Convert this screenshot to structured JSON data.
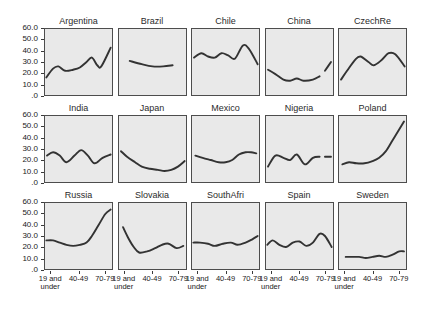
{
  "figure": {
    "background_color": "#ffffff",
    "panel_fill": "#e9e9e9",
    "panel_border_color": "#4d4d4d",
    "line_color": "#333333"
  },
  "axis": {
    "y_tick_labels": [
      "60.0",
      "50.0",
      "40.0",
      "30.0",
      "20.0",
      "10.0",
      ".0"
    ],
    "x_tick_labels": [
      "19 and under",
      "40-49",
      "70-79"
    ]
  },
  "chart_data": {
    "type": "line",
    "title": "",
    "xlabel": "",
    "ylabel": "",
    "ylim": [
      0,
      60
    ],
    "yticks": [
      0,
      10,
      20,
      30,
      40,
      50,
      60
    ],
    "ytick_labels": [
      "60.0",
      "50.0",
      "40.0",
      "30.0",
      "20.0",
      "10.0",
      ".0"
    ],
    "x": [
      "19 and under",
      "20-29",
      "30-39",
      "40-49",
      "50-59",
      "60-69",
      "70-79",
      "80 and over"
    ],
    "xticks": [
      "19 and under",
      "40-49",
      "70-79"
    ],
    "grid": false,
    "legend": "none",
    "layout": {
      "rows": 3,
      "cols": 5
    },
    "panels": [
      {
        "name": "Argentina",
        "row": 1,
        "col": 1,
        "values": [
          16,
          24,
          26,
          22,
          23,
          25,
          30,
          34,
          27,
          26,
          43
        ],
        "points": [
          [
            0.02,
            16
          ],
          [
            0.12,
            24
          ],
          [
            0.2,
            26
          ],
          [
            0.3,
            22
          ],
          [
            0.42,
            23
          ],
          [
            0.52,
            25
          ],
          [
            0.62,
            30
          ],
          [
            0.7,
            34
          ],
          [
            0.78,
            27
          ],
          [
            0.84,
            26
          ],
          [
            0.98,
            43
          ]
        ]
      },
      {
        "name": "Brazil",
        "row": 1,
        "col": 2,
        "values": [
          31,
          28,
          26,
          26,
          27
        ],
        "points": [
          [
            0.16,
            31
          ],
          [
            0.34,
            28
          ],
          [
            0.5,
            26
          ],
          [
            0.66,
            26
          ],
          [
            0.8,
            27
          ]
        ]
      },
      {
        "name": "Chile",
        "row": 1,
        "col": 3,
        "values": [
          34,
          38,
          35,
          34,
          38,
          36,
          33,
          45,
          42,
          28
        ],
        "points": [
          [
            0.03,
            34
          ],
          [
            0.14,
            38
          ],
          [
            0.24,
            35
          ],
          [
            0.34,
            34
          ],
          [
            0.44,
            38
          ],
          [
            0.54,
            36
          ],
          [
            0.64,
            33
          ],
          [
            0.76,
            45
          ],
          [
            0.85,
            42
          ],
          [
            0.98,
            28
          ]
        ]
      },
      {
        "name": "China",
        "row": 1,
        "col": 4,
        "values": [
          23,
          19,
          14,
          13,
          15,
          13,
          14,
          17,
          26
        ],
        "points": [
          [
            0.03,
            23
          ],
          [
            0.14,
            19
          ],
          [
            0.26,
            14
          ],
          [
            0.36,
            13
          ],
          [
            0.46,
            15
          ],
          [
            0.56,
            13
          ],
          [
            0.7,
            14
          ],
          [
            0.8,
            17
          ]
        ],
        "detached_segment": [
          [
            0.88,
            22
          ],
          [
            0.97,
            30
          ]
        ]
      },
      {
        "name": "CzechRe",
        "row": 1,
        "col": 5,
        "values": [
          14,
          22,
          32,
          35,
          30,
          27,
          32,
          38,
          37,
          26
        ],
        "points": [
          [
            0.03,
            14
          ],
          [
            0.12,
            22
          ],
          [
            0.24,
            32
          ],
          [
            0.32,
            35
          ],
          [
            0.44,
            30
          ],
          [
            0.52,
            27
          ],
          [
            0.64,
            32
          ],
          [
            0.74,
            38
          ],
          [
            0.84,
            37
          ],
          [
            0.98,
            26
          ]
        ]
      },
      {
        "name": "India",
        "row": 2,
        "col": 1,
        "values": [
          24,
          27,
          24,
          18,
          24,
          29,
          24,
          17,
          22,
          25
        ],
        "points": [
          [
            0.03,
            24
          ],
          [
            0.12,
            27
          ],
          [
            0.22,
            24
          ],
          [
            0.32,
            18
          ],
          [
            0.44,
            24
          ],
          [
            0.54,
            29
          ],
          [
            0.64,
            24
          ],
          [
            0.74,
            17
          ],
          [
            0.86,
            22
          ],
          [
            0.98,
            25
          ]
        ]
      },
      {
        "name": "Japan",
        "row": 2,
        "col": 2,
        "values": [
          28,
          23,
          18,
          14,
          12,
          11,
          10,
          11,
          14,
          19
        ],
        "points": [
          [
            0.03,
            28
          ],
          [
            0.12,
            23
          ],
          [
            0.24,
            18
          ],
          [
            0.34,
            14
          ],
          [
            0.46,
            12
          ],
          [
            0.58,
            11
          ],
          [
            0.68,
            10
          ],
          [
            0.78,
            11
          ],
          [
            0.88,
            14
          ],
          [
            0.98,
            19
          ]
        ]
      },
      {
        "name": "Mexico",
        "row": 2,
        "col": 3,
        "values": [
          24,
          22,
          20,
          18,
          18,
          20,
          25,
          27,
          27,
          26
        ],
        "points": [
          [
            0.05,
            24
          ],
          [
            0.16,
            22
          ],
          [
            0.28,
            20
          ],
          [
            0.4,
            18
          ],
          [
            0.5,
            18
          ],
          [
            0.6,
            20
          ],
          [
            0.7,
            25
          ],
          [
            0.8,
            27
          ],
          [
            0.88,
            27
          ],
          [
            0.96,
            26
          ]
        ]
      },
      {
        "name": "Nigeria",
        "row": 2,
        "col": 4,
        "values": [
          14,
          24,
          22,
          20,
          25,
          16,
          22,
          23
        ],
        "points": [
          [
            0.03,
            14
          ],
          [
            0.14,
            24
          ],
          [
            0.26,
            22
          ],
          [
            0.36,
            20
          ],
          [
            0.46,
            25
          ],
          [
            0.58,
            16
          ],
          [
            0.7,
            22
          ],
          [
            0.8,
            23
          ]
        ],
        "detached_segment": [
          [
            0.88,
            23
          ],
          [
            0.97,
            23
          ]
        ]
      },
      {
        "name": "Poland",
        "row": 2,
        "col": 5,
        "values": [
          16,
          18,
          17,
          17,
          19,
          22,
          28,
          38,
          48,
          55
        ],
        "points": [
          [
            0.05,
            16
          ],
          [
            0.15,
            18
          ],
          [
            0.26,
            17
          ],
          [
            0.38,
            17
          ],
          [
            0.5,
            19
          ],
          [
            0.6,
            22
          ],
          [
            0.7,
            28
          ],
          [
            0.8,
            38
          ],
          [
            0.9,
            48
          ],
          [
            0.97,
            55
          ]
        ]
      },
      {
        "name": "Russia",
        "row": 3,
        "col": 1,
        "values": [
          26,
          26,
          24,
          22,
          21,
          22,
          24,
          30,
          40,
          50,
          54
        ],
        "points": [
          [
            0.02,
            26
          ],
          [
            0.12,
            26
          ],
          [
            0.22,
            24
          ],
          [
            0.32,
            22
          ],
          [
            0.42,
            21
          ],
          [
            0.52,
            22
          ],
          [
            0.62,
            24
          ],
          [
            0.7,
            30
          ],
          [
            0.8,
            40
          ],
          [
            0.9,
            50
          ],
          [
            0.98,
            54
          ]
        ]
      },
      {
        "name": "Slovakia",
        "row": 3,
        "col": 2,
        "values": [
          38,
          28,
          20,
          15,
          16,
          19,
          22,
          23,
          19,
          21
        ],
        "points": [
          [
            0.06,
            38
          ],
          [
            0.14,
            28
          ],
          [
            0.22,
            20
          ],
          [
            0.3,
            15
          ],
          [
            0.42,
            16
          ],
          [
            0.54,
            19
          ],
          [
            0.64,
            22
          ],
          [
            0.74,
            23
          ],
          [
            0.86,
            19
          ],
          [
            0.96,
            21
          ]
        ]
      },
      {
        "name": "SouthAfri",
        "row": 3,
        "col": 3,
        "values": [
          24,
          24,
          23,
          21,
          23,
          24,
          22,
          24,
          27,
          30
        ],
        "points": [
          [
            0.02,
            24
          ],
          [
            0.12,
            24
          ],
          [
            0.24,
            23
          ],
          [
            0.34,
            21
          ],
          [
            0.46,
            23
          ],
          [
            0.58,
            24
          ],
          [
            0.68,
            22
          ],
          [
            0.8,
            24
          ],
          [
            0.9,
            27
          ],
          [
            0.98,
            30
          ]
        ]
      },
      {
        "name": "Spain",
        "row": 3,
        "col": 4,
        "values": [
          22,
          26,
          22,
          20,
          24,
          25,
          21,
          24,
          32,
          30,
          20
        ],
        "points": [
          [
            0.02,
            22
          ],
          [
            0.1,
            26
          ],
          [
            0.2,
            22
          ],
          [
            0.3,
            20
          ],
          [
            0.4,
            24
          ],
          [
            0.5,
            25
          ],
          [
            0.6,
            21
          ],
          [
            0.7,
            24
          ],
          [
            0.8,
            32
          ],
          [
            0.88,
            30
          ],
          [
            0.98,
            20
          ]
        ]
      },
      {
        "name": "Sweden",
        "row": 3,
        "col": 5,
        "values": [
          11,
          11,
          11,
          10,
          11,
          12,
          11,
          13,
          16,
          16
        ],
        "points": [
          [
            0.1,
            11
          ],
          [
            0.2,
            11
          ],
          [
            0.3,
            11
          ],
          [
            0.4,
            10
          ],
          [
            0.5,
            11
          ],
          [
            0.6,
            12
          ],
          [
            0.7,
            11
          ],
          [
            0.8,
            13
          ],
          [
            0.9,
            16
          ],
          [
            0.97,
            16
          ]
        ]
      }
    ]
  }
}
